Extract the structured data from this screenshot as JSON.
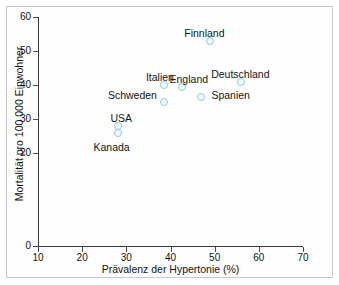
{
  "chart_data": {
    "type": "scatter",
    "title": "",
    "xlabel": "Prävalenz der Hypertonie (%)",
    "ylabel": "Mortalität pro 100 000 Einwohner",
    "xlim": [
      10,
      70
    ],
    "ylim": [
      0,
      60
    ],
    "xticks": [
      10,
      20,
      30,
      40,
      50,
      60,
      70
    ],
    "xtick_labels": [
      "10",
      "20",
      "30",
      "40",
      "50",
      "60",
      "70"
    ],
    "yticks": [
      0,
      20,
      30,
      40,
      50,
      60
    ],
    "ytick_labels": [
      "0",
      "20",
      "30",
      "40",
      "50",
      "60"
    ],
    "grid": false,
    "legend": "none",
    "marker_color": "#8fcbe0",
    "marker_style": "open-circle",
    "points": [
      {
        "label": "Finnland",
        "x": 49.0,
        "y": 53.0,
        "label_dx": -26,
        "label_dy": -14
      },
      {
        "label": "Deutschland",
        "x": 56.0,
        "y": 41.0,
        "label_dx": -30,
        "label_dy": -14
      },
      {
        "label": "Italien",
        "x": 38.5,
        "y": 40.0,
        "label_dx": -18,
        "label_dy": -14
      },
      {
        "label": "England",
        "x": 42.5,
        "y": 39.5,
        "label_dx": -12,
        "label_dy": -14
      },
      {
        "label": "Spanien",
        "x": 47.0,
        "y": 36.5,
        "label_dx": 10,
        "label_dy": -8
      },
      {
        "label": "Schweden",
        "x": 38.5,
        "y": 35.0,
        "label_dx": -56,
        "label_dy": -13
      },
      {
        "label": "USA",
        "x": 28.0,
        "y": 28.0,
        "label_dx": -7,
        "label_dy": -14
      },
      {
        "label": "Kanada",
        "x": 28.0,
        "y": 26.0,
        "label_dx": -24,
        "label_dy": 8
      }
    ]
  },
  "colors": {
    "marker_stroke": "#8fcbe0",
    "axis": "#3a3a3a",
    "text": "#121212",
    "frame": "#c9c9c9"
  }
}
